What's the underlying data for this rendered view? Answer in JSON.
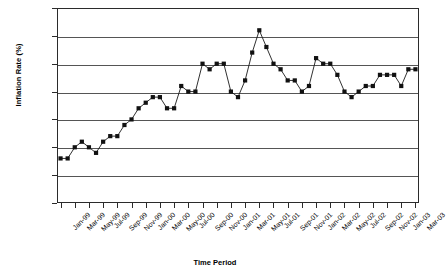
{
  "chart_data": {
    "type": "line",
    "title": "",
    "xlabel": "Time Period",
    "ylabel": "Inflation Rate (%)",
    "ylim": [
      0,
      3.5
    ],
    "ytick_values": [
      0,
      0.5,
      1,
      1.5,
      2,
      2.5,
      3,
      3.5
    ],
    "ytick_labels": [
      "0",
      "0.5",
      "1",
      "1.5",
      "2",
      "2.5",
      "3",
      "3.5"
    ],
    "grid": true,
    "legend": false,
    "marker": "square",
    "line_color": "#1a1a1a",
    "marker_color": "#111111",
    "x": [
      "Jan-99",
      "Feb-99",
      "Mar-99",
      "Apr-99",
      "May-99",
      "Jun-99",
      "Jul-99",
      "Aug-99",
      "Sep-99",
      "Oct-99",
      "Nov-99",
      "Dec-99",
      "Jan-00",
      "Feb-00",
      "Mar-00",
      "Apr-00",
      "May-00",
      "Jun-00",
      "Jul-00",
      "Aug-00",
      "Sep-00",
      "Oct-00",
      "Nov-00",
      "Dec-00",
      "Jan-01",
      "Feb-01",
      "Mar-01",
      "Apr-01",
      "May-01",
      "Jun-01",
      "Jul-01",
      "Aug-01",
      "Sep-01",
      "Oct-01",
      "Nov-01",
      "Dec-01",
      "Jan-02",
      "Feb-02",
      "Mar-02",
      "Apr-02",
      "May-02",
      "Jun-02",
      "Jul-02",
      "Aug-02",
      "Sep-02",
      "Oct-02",
      "Nov-02",
      "Dec-02",
      "Jan-03",
      "Feb-03",
      "Mar-03"
    ],
    "values": [
      0.8,
      0.8,
      1.0,
      1.1,
      1.0,
      0.9,
      1.1,
      1.2,
      1.2,
      1.4,
      1.5,
      1.7,
      1.8,
      1.9,
      1.9,
      1.7,
      1.7,
      2.1,
      2.0,
      2.0,
      2.5,
      2.4,
      2.5,
      2.5,
      2.0,
      1.9,
      2.2,
      2.7,
      3.1,
      2.8,
      2.5,
      2.4,
      2.2,
      2.2,
      2.0,
      2.1,
      2.6,
      2.5,
      2.5,
      2.3,
      2.0,
      1.9,
      2.0,
      2.1,
      2.1,
      2.3,
      2.3,
      2.3,
      2.1,
      2.4,
      2.4
    ],
    "xtick_labels": [
      "Jan-99",
      "Mar-99",
      "May-99",
      "Jul-99",
      "Sep-99",
      "Nov-99",
      "Jan-00",
      "Mar-00",
      "May-00",
      "Jul-00",
      "Sep-00",
      "Nov-00",
      "Jan-01",
      "Mar-01",
      "May-01",
      "Jul-01",
      "Sep-01",
      "Nov-01",
      "Jan-02",
      "Mar-02",
      "May-02",
      "Jul-02",
      "Sep-02",
      "Nov-02",
      "Jan-03",
      "Mar-03"
    ]
  }
}
